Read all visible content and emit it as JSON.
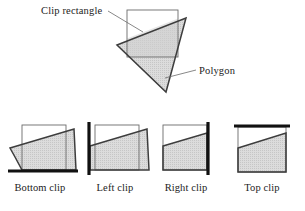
{
  "figure": {
    "background_color": "#ffffff",
    "ink_color": "#1c1c1c",
    "fill_color": "#d9d9d9",
    "bold_edge_color": "#111111",
    "thin_edge_color": "#6b6b6b"
  },
  "main": {
    "clip_rectangle_label": "Clip rectangle",
    "polygon_label": "Polygon",
    "clip_rectangle": {
      "x": 127,
      "y": 10,
      "width": 51,
      "height": 47
    },
    "polygon_points": "117,45 186,18 166,92",
    "clipped_region_points": "127,38.5 178,18.6 178,57 127,57",
    "clip_leader_path": "M 108,11 L 143,32",
    "polygon_leader_path": "M 196,70 L 165,78"
  },
  "stages": [
    {
      "name": "bottom-clip",
      "caption": "Bottom clip",
      "origin_x": 8,
      "rect": {
        "x": 22,
        "y": 125,
        "width": 44,
        "height": 45
      },
      "poly_points": "10,148 74,129 76,170 22,170 15,157",
      "bold_edge": "M 8,171 L 78,171",
      "caption_x": 40,
      "caption_y": 191
    },
    {
      "name": "left-clip",
      "caption": "Left clip",
      "origin_x": 86,
      "rect": {
        "x": 95,
        "y": 125,
        "width": 44,
        "height": 45
      },
      "poly_points": "90,146 147,129 149,170 90,170",
      "bold_edge": "M 89,122 L 89,175",
      "caption_x": 115,
      "caption_y": 191
    },
    {
      "name": "right-clip",
      "caption": "Right clip",
      "origin_x": 160,
      "rect": {
        "x": 163,
        "y": 125,
        "width": 44,
        "height": 45
      },
      "poly_points": "163,146 207,133 207,170 163,170",
      "bold_edge": "M 208,122 L 208,175",
      "caption_x": 186,
      "caption_y": 191
    },
    {
      "name": "top-clip",
      "caption": "Top clip",
      "origin_x": 232,
      "rect": {
        "x": 238,
        "y": 127,
        "width": 48,
        "height": 45
      },
      "poly_points": "238,148 286,133 286,172 238,172",
      "bold_edge": "M 234,126 L 290,126",
      "caption_x": 262,
      "caption_y": 191
    }
  ]
}
